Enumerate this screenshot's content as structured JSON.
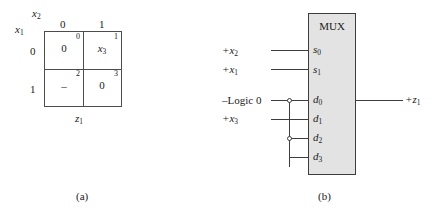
{
  "figure": {
    "panels": [
      {
        "caption": "(a)",
        "kind": "karnaugh-map"
      },
      {
        "caption": "(b)",
        "kind": "mux-schematic"
      }
    ]
  },
  "kmap": {
    "top_variable": {
      "base": "x",
      "sub": "2"
    },
    "left_variable": {
      "base": "x",
      "sub": "1"
    },
    "output_variable": {
      "base": "z",
      "sub": "1"
    },
    "column_headers": [
      "0",
      "1"
    ],
    "row_headers": [
      "0",
      "1"
    ],
    "cells": [
      {
        "index": "0",
        "value": "0",
        "value_base": "0",
        "value_sub": "",
        "row": 0,
        "col": 0
      },
      {
        "index": "1",
        "value": "x3",
        "value_base": "x",
        "value_sub": "3",
        "row": 0,
        "col": 1
      },
      {
        "index": "2",
        "value": "–",
        "value_base": "–",
        "value_sub": "",
        "row": 1,
        "col": 0
      },
      {
        "index": "3",
        "value": "0",
        "value_base": "0",
        "value_sub": "",
        "row": 1,
        "col": 1
      }
    ]
  },
  "mux": {
    "title": "MUX",
    "select_pins": [
      {
        "name": "s0",
        "base": "s",
        "sub": "0",
        "source_base": "+x",
        "source_sub": "2"
      },
      {
        "name": "s1",
        "base": "s",
        "sub": "1",
        "source_base": "+x",
        "source_sub": "1"
      }
    ],
    "data_pins": [
      {
        "name": "d0",
        "base": "d",
        "sub": "0"
      },
      {
        "name": "d1",
        "base": "d",
        "sub": "1"
      },
      {
        "name": "d2",
        "base": "d",
        "sub": "2"
      },
      {
        "name": "d3",
        "base": "d",
        "sub": "3"
      }
    ],
    "inputs": [
      {
        "label": "+x2",
        "base": "+x",
        "sub": "2",
        "to": "s0"
      },
      {
        "label": "+x1",
        "base": "+x",
        "sub": "1",
        "to": "s1"
      },
      {
        "label": "–Logic 0",
        "base": "–Logic 0",
        "sub": "",
        "to": "d0"
      },
      {
        "label": "+x3",
        "base": "+x",
        "sub": "3",
        "to": "d1"
      }
    ],
    "output": {
      "base": "+z",
      "sub": "1"
    },
    "junctions": [
      "d0",
      "d2"
    ],
    "bus_connects": [
      "d0",
      "d2",
      "d3"
    ],
    "colors": {
      "box_fill": "#e3e3e3",
      "box_border": "#3d3d3d",
      "wire": "#3d3d3d"
    }
  }
}
